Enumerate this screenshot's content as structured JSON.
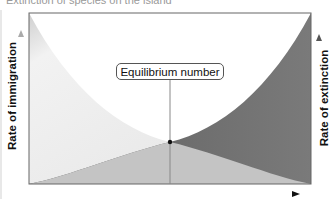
{
  "diagram": {
    "top_caption": "Extinction of species on the island",
    "y_axis_left_label": "Rate of immigration",
    "y_axis_right_label": "Rate of extinction",
    "equilibrium_label": "Equilibrium number",
    "x_axis_arrow": "arrow-right",
    "colors": {
      "immigration_fill": "#ebebeb",
      "extinction_fill": "#6e6e6e",
      "overlap_fill": "#c4c4c4",
      "frame": "#666666",
      "background": "#ffffff"
    },
    "equilibrium_point": {
      "x": 170,
      "y": 142
    }
  }
}
